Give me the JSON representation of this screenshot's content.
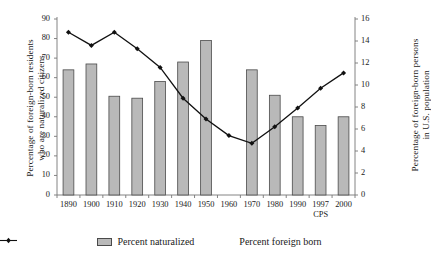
{
  "chart_data": {
    "type": "bar",
    "title": "",
    "xlabel": "",
    "categories": [
      "1890",
      "1900",
      "1910",
      "1920",
      "1930",
      "1940",
      "1950",
      "1960",
      "1970",
      "1980",
      "1990",
      "1997",
      "2000"
    ],
    "category_sublabels": [
      "",
      "",
      "",
      "",
      "",
      "",
      "",
      "",
      "",
      "",
      "",
      "CPS",
      ""
    ],
    "grid": false,
    "legend_position": "bottom",
    "axes": {
      "left": {
        "label_line1": "Percentage of foreign-born residents",
        "label_line2": "who are naturalized citizens",
        "ylim": [
          0,
          90
        ],
        "ticks": [
          0,
          10,
          20,
          30,
          40,
          50,
          60,
          70,
          80,
          90
        ]
      },
      "right": {
        "label_line1": "Percentage of foreign-born persons",
        "label_line2": "in U.S. population",
        "ylim": [
          0,
          16
        ],
        "ticks": [
          0,
          2,
          4,
          6,
          8,
          10,
          12,
          14,
          16
        ]
      }
    },
    "series": [
      {
        "name": "Percent naturalized",
        "type": "bar",
        "axis": "left",
        "color": "#b9b9b9",
        "edge_color": "#4a4a4a",
        "values": [
          64,
          67,
          50.5,
          49.5,
          58,
          68,
          79,
          null,
          64,
          51,
          40,
          35.5,
          40
        ]
      },
      {
        "name": "Percent foreign born",
        "type": "line",
        "axis": "right",
        "color": "#111111",
        "marker": "diamond",
        "values": [
          14.8,
          13.6,
          14.8,
          13.3,
          11.6,
          8.8,
          6.9,
          5.4,
          4.7,
          6.2,
          7.9,
          9.7,
          11.1
        ]
      }
    ]
  },
  "legend": {
    "items": [
      {
        "label": "Percent naturalized",
        "marker": "bar-swatch"
      },
      {
        "label": "Percent foreign born",
        "marker": "line-marker-swatch"
      }
    ]
  }
}
